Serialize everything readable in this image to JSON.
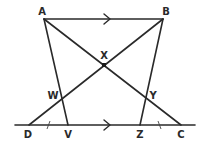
{
  "diagram": {
    "type": "geometry-figure",
    "points": {
      "A": {
        "label": "A",
        "x": 44,
        "y": 19
      },
      "B": {
        "label": "B",
        "x": 163,
        "y": 19
      },
      "X": {
        "label": "X",
        "x": 104,
        "y": 65
      },
      "W": {
        "label": "W",
        "x": 63,
        "y": 97
      },
      "Y": {
        "label": "Y",
        "x": 146,
        "y": 97
      },
      "D": {
        "label": "D",
        "x": 29,
        "y": 125
      },
      "V": {
        "label": "V",
        "x": 68,
        "y": 125
      },
      "Z": {
        "label": "Z",
        "x": 140,
        "y": 125
      },
      "C": {
        "label": "C",
        "x": 181,
        "y": 125
      }
    },
    "segments": [
      "AB",
      "AC",
      "BD",
      "AV",
      "BZ",
      "DC-line"
    ],
    "parallel_marks": [
      {
        "segment": "AB",
        "symbol": "single-arrow"
      },
      {
        "segment": "DC",
        "symbol": "single-arrow"
      }
    ],
    "equal_marks": [
      {
        "segment": "DV",
        "symbol": "single-tick"
      },
      {
        "segment": "ZC",
        "symbol": "single-tick"
      }
    ],
    "colors": {
      "stroke": "#2a2a2a",
      "background": "#ffffff"
    }
  }
}
